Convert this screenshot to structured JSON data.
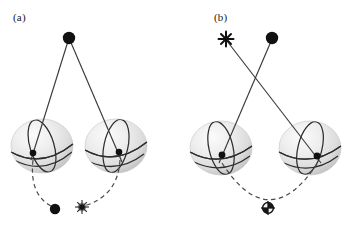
{
  "figure": {
    "type": "schematic-diagram",
    "background_color": "#ffffff",
    "width": 355,
    "height": 225,
    "colors": {
      "line": "#3a3a3a",
      "marker_fill": "#111111",
      "sphere_fill_light": "#f2f2f2",
      "sphere_fill_shade": "#cfcfcf",
      "great_circle": "#2b2b2b",
      "dashed": "#4a4a4a"
    }
  },
  "panels": [
    {
      "id": "a",
      "label": "(a)",
      "label_pos": {
        "x": 13,
        "y": 11
      },
      "apex_markers": [
        {
          "name": "apex-dot",
          "glyph": "filled-circle",
          "x": 69,
          "y": 38,
          "r": 6.2
        }
      ],
      "spheres": [
        {
          "name": "sphere-left",
          "cx": 42,
          "cy": 146,
          "rx": 31,
          "ry": 27,
          "contact": {
            "x": 33,
            "y": 153
          }
        },
        {
          "name": "sphere-right",
          "cx": 116,
          "cy": 146,
          "rx": 31,
          "ry": 27,
          "contact": {
            "x": 119,
            "y": 152
          }
        }
      ],
      "rays": [
        {
          "name": "ray-apex-to-left-sphere",
          "from": {
            "x": 69,
            "y": 38
          },
          "to": {
            "x": 33,
            "y": 153
          }
        },
        {
          "name": "ray-apex-to-right-sphere",
          "from": {
            "x": 69,
            "y": 38
          },
          "to": {
            "x": 121,
            "y": 155
          }
        }
      ],
      "arcs": [
        {
          "name": "dashed-arc-left",
          "from": {
            "x": 33,
            "y": 163
          },
          "to": {
            "x": 53,
            "y": 208
          },
          "ctrl": {
            "x": 30,
            "y": 196
          }
        },
        {
          "name": "dashed-arc-right",
          "from": {
            "x": 119,
            "y": 163
          },
          "to": {
            "x": 82,
            "y": 206
          },
          "ctrl": {
            "x": 117,
            "y": 196
          }
        }
      ],
      "bottom_markers": [
        {
          "name": "image-point-dot",
          "glyph": "filled-circle",
          "x": 55,
          "y": 209,
          "r": 5.2
        },
        {
          "name": "image-point-burst",
          "glyph": "starburst",
          "x": 82,
          "y": 207,
          "r": 5.0
        }
      ]
    },
    {
      "id": "b",
      "label": "(b)",
      "label_pos": {
        "x": 214,
        "y": 11
      },
      "apex_markers": [
        {
          "name": "apex-star",
          "glyph": "six-point-star",
          "x": 226,
          "y": 39,
          "r": 6.0
        },
        {
          "name": "apex-dot",
          "glyph": "filled-circle",
          "x": 272,
          "y": 38,
          "r": 6.2
        }
      ],
      "spheres": [
        {
          "name": "sphere-left",
          "cx": 221,
          "cy": 148,
          "rx": 31,
          "ry": 27,
          "contact": {
            "x": 222,
            "y": 155
          }
        },
        {
          "name": "sphere-right",
          "cx": 310,
          "cy": 148,
          "rx": 31,
          "ry": 27,
          "contact": {
            "x": 317,
            "y": 156
          }
        }
      ],
      "rays": [
        {
          "name": "ray-star-to-right-sphere",
          "from": {
            "x": 226,
            "y": 40
          },
          "to": {
            "x": 319,
            "y": 158
          }
        },
        {
          "name": "ray-dot-to-left-sphere",
          "from": {
            "x": 272,
            "y": 39
          },
          "to": {
            "x": 221,
            "y": 156
          }
        }
      ],
      "arcs": [
        {
          "name": "dashed-arc-span",
          "from": {
            "x": 222,
            "y": 165
          },
          "to": {
            "x": 317,
            "y": 166
          },
          "ctrl": {
            "x": 269,
            "y": 232
          }
        }
      ],
      "bottom_markers": [
        {
          "name": "image-point-crosshair",
          "glyph": "circled-cross",
          "x": 268,
          "y": 208,
          "r": 5.6
        }
      ]
    }
  ]
}
